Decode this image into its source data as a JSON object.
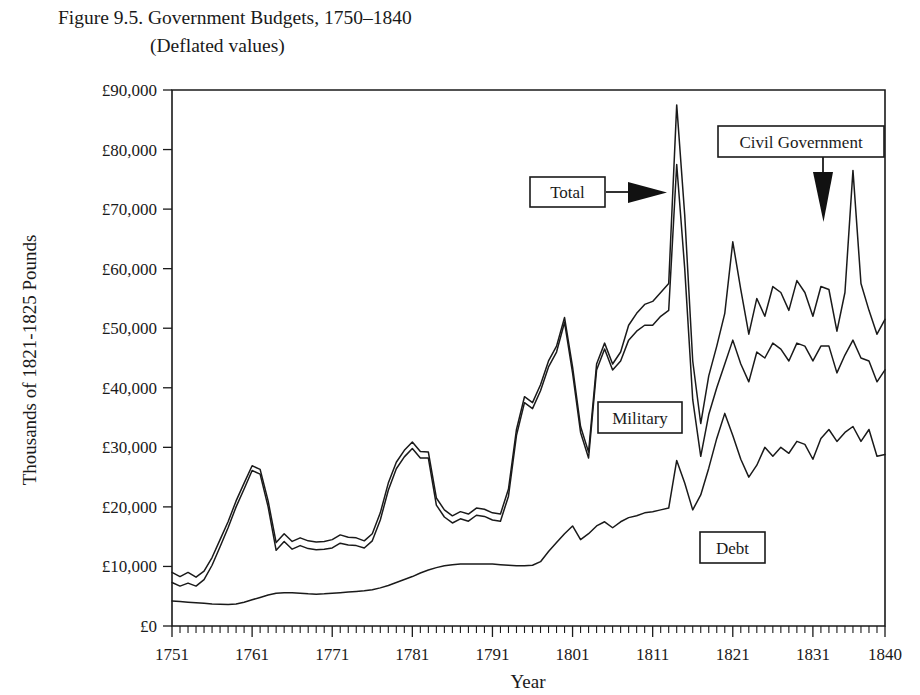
{
  "figure": {
    "title_line1": "Figure 9.5.  Government Budgets, 1750–1840",
    "title_line2": "(Deflated values)",
    "title_prefix": "Figure 9.5.",
    "title_main": "Government Budgets, 1750–1840",
    "subtitle": "(Deflated values)"
  },
  "annotations": [
    {
      "label": "Total",
      "type": "callout-box",
      "arrow": "right-arrow-icon"
    },
    {
      "label": "Civil Government",
      "type": "callout-box",
      "arrow": "down-arrow-icon"
    },
    {
      "label": "Military",
      "type": "callout-box",
      "arrow": "none"
    },
    {
      "label": "Debt",
      "type": "callout-box",
      "arrow": "none"
    }
  ],
  "chart_data": {
    "type": "line",
    "title": "Figure 9.5.  Government Budgets, 1750–1840 (Deflated values)",
    "xlabel": "Year",
    "ylabel": "Thousands of 1821-1825 Pounds",
    "xlim": [
      1751,
      1840
    ],
    "ylim": [
      0,
      90000
    ],
    "ytick_values": [
      0,
      10000,
      20000,
      30000,
      40000,
      50000,
      60000,
      70000,
      80000,
      90000
    ],
    "ytick_labels": [
      "£0",
      "£10,000",
      "£20,000",
      "£30,000",
      "£40,000",
      "£50,000",
      "£60,000",
      "£70,000",
      "£80,000",
      "£90,000"
    ],
    "xtick_values": [
      1751,
      1761,
      1771,
      1781,
      1791,
      1801,
      1811,
      1821,
      1831,
      1840
    ],
    "xtick_labels": [
      "1751",
      "1761",
      "1771",
      "1781",
      "1791",
      "1801",
      "1811",
      "1821",
      "1831",
      "1840"
    ],
    "x_minor_tick_interval": 1,
    "grid": false,
    "legend": "inline-callout-boxes",
    "units": "Thousands of 1821-1825 Pounds",
    "x": [
      1751,
      1752,
      1753,
      1754,
      1755,
      1756,
      1757,
      1758,
      1759,
      1760,
      1761,
      1762,
      1763,
      1764,
      1765,
      1766,
      1767,
      1768,
      1769,
      1770,
      1771,
      1772,
      1773,
      1774,
      1775,
      1776,
      1777,
      1778,
      1779,
      1780,
      1781,
      1782,
      1783,
      1784,
      1785,
      1786,
      1787,
      1788,
      1789,
      1790,
      1791,
      1792,
      1793,
      1794,
      1795,
      1796,
      1797,
      1798,
      1799,
      1800,
      1801,
      1802,
      1803,
      1804,
      1805,
      1806,
      1807,
      1808,
      1809,
      1810,
      1811,
      1812,
      1813,
      1814,
      1815,
      1816,
      1817,
      1818,
      1819,
      1820,
      1821,
      1822,
      1823,
      1824,
      1825,
      1826,
      1827,
      1828,
      1829,
      1830,
      1831,
      1832,
      1833,
      1834,
      1835,
      1836,
      1837,
      1838,
      1839,
      1840
    ],
    "series": [
      {
        "name": "Total",
        "values": [
          9000,
          8300,
          9000,
          8200,
          9200,
          11500,
          14500,
          17500,
          21000,
          24000,
          26900,
          26300,
          21000,
          14000,
          15500,
          14200,
          14800,
          14300,
          14100,
          14200,
          14500,
          15300,
          14900,
          14800,
          14300,
          15500,
          19000,
          24000,
          27500,
          29500,
          30900,
          29300,
          29200,
          21500,
          19500,
          18500,
          19200,
          18800,
          19800,
          19600,
          19000,
          18800,
          23000,
          33000,
          38500,
          37500,
          40500,
          44500,
          47000,
          51800,
          43500,
          33500,
          29200,
          44000,
          47500,
          44000,
          46000,
          50500,
          52500,
          54000,
          54500,
          56000,
          57500,
          87500,
          69000,
          44500,
          34000,
          42000,
          47000,
          52500,
          64500,
          56500,
          49000,
          55000,
          52000,
          57000,
          56000,
          53000,
          58000,
          56000,
          52000,
          57000,
          56500,
          49500,
          56000,
          76500,
          57500,
          53000,
          49000,
          51500
        ]
      },
      {
        "name": "Military",
        "values": [
          7300,
          6700,
          7200,
          6700,
          7800,
          10200,
          13300,
          16500,
          20000,
          23000,
          26100,
          25500,
          20000,
          12700,
          14200,
          12900,
          13500,
          13000,
          12800,
          12900,
          13100,
          13900,
          13600,
          13500,
          13100,
          14300,
          17800,
          22800,
          26400,
          28400,
          29800,
          28200,
          28200,
          20300,
          18300,
          17300,
          18000,
          17600,
          18600,
          18400,
          17800,
          17600,
          21800,
          32000,
          37500,
          36500,
          39500,
          43500,
          46000,
          51000,
          42500,
          32500,
          28200,
          43000,
          46500,
          43000,
          44500,
          48000,
          49500,
          50500,
          50500,
          52000,
          53000,
          77500,
          60000,
          38000,
          28500,
          35500,
          40000,
          44000,
          48000,
          44000,
          41000,
          46000,
          45000,
          47500,
          46500,
          44500,
          47500,
          47000,
          44500,
          47000,
          47000,
          42500,
          45500,
          48000,
          45000,
          44500,
          41000,
          43000
        ]
      },
      {
        "name": "Debt",
        "values": [
          4200,
          4100,
          4000,
          3900,
          3800,
          3700,
          3650,
          3600,
          3700,
          4000,
          4400,
          4800,
          5200,
          5500,
          5600,
          5600,
          5500,
          5400,
          5350,
          5400,
          5500,
          5600,
          5700,
          5800,
          5900,
          6100,
          6400,
          6800,
          7300,
          7800,
          8300,
          8900,
          9400,
          9800,
          10100,
          10300,
          10400,
          10400,
          10400,
          10400,
          10400,
          10300,
          10200,
          10100,
          10100,
          10200,
          10800,
          12500,
          14000,
          15500,
          16800,
          14500,
          15500,
          16800,
          17500,
          16500,
          17500,
          18200,
          18500,
          19000,
          19200,
          19500,
          19800,
          27800,
          24000,
          19500,
          22000,
          26500,
          31500,
          35700,
          32000,
          28000,
          25000,
          27000,
          30000,
          28500,
          30000,
          29000,
          31000,
          30500,
          28000,
          31500,
          33000,
          31000,
          32500,
          33500,
          31000,
          33000,
          28500,
          28800
        ]
      }
    ],
    "notable_points": [
      {
        "year": 1761,
        "series": "Total",
        "value": 26900,
        "note": "Seven Years' War peak"
      },
      {
        "year": 1781,
        "series": "Total",
        "value": 30900,
        "note": "American Revolution peak"
      },
      {
        "year": 1802,
        "series": "Total",
        "value": 33500,
        "note": "Peace of Amiens dip"
      },
      {
        "year": 1814,
        "series": "Total",
        "value": 87500,
        "note": "Napoleonic Wars peak"
      },
      {
        "year": 1814,
        "series": "Military",
        "value": 77500,
        "note": "Napoleonic Wars military peak"
      },
      {
        "year": 1836,
        "series": "Total",
        "value": 76500,
        "note": "Late spike"
      }
    ]
  }
}
